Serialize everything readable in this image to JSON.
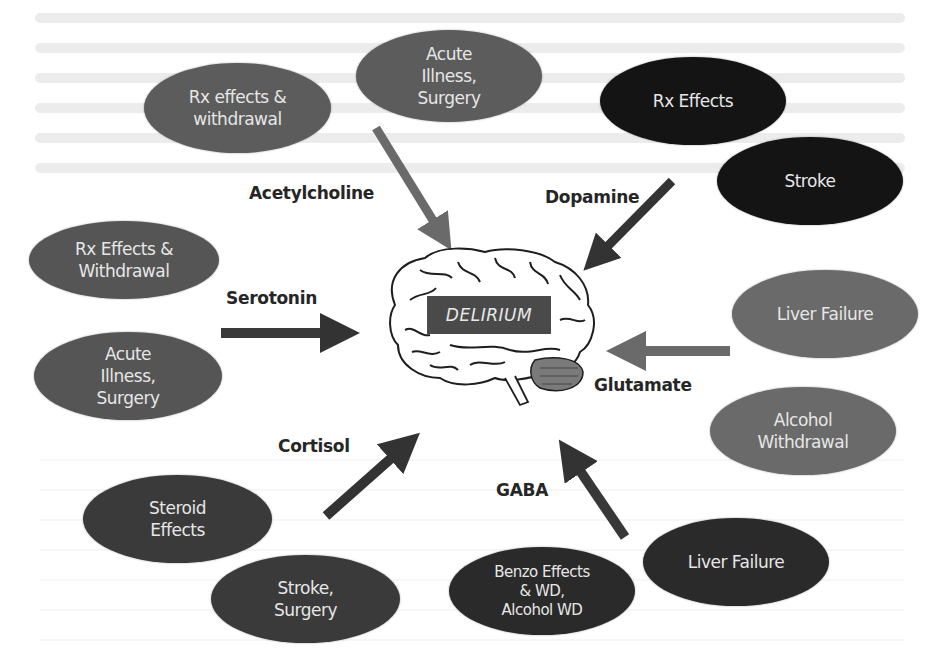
{
  "center": {
    "label": "DELIRIUM",
    "icon": "brain-icon"
  },
  "neurotransmitters": [
    {
      "id": "acetylcholine",
      "label": "Acetylcholine"
    },
    {
      "id": "dopamine",
      "label": "Dopamine"
    },
    {
      "id": "serotonin",
      "label": "Serotonin"
    },
    {
      "id": "glutamate",
      "label": "Glutamate"
    },
    {
      "id": "cortisol",
      "label": "Cortisol"
    },
    {
      "id": "gaba",
      "label": "GABA"
    }
  ],
  "causes": [
    {
      "id": "ach-rx",
      "group": "acetylcholine",
      "label": "Rx effects &\nwithdrawal",
      "color": "#5a5a5a"
    },
    {
      "id": "ach-acute",
      "group": "acetylcholine",
      "label": "Acute\nIllness,\nSurgery",
      "color": "#5a5a5a"
    },
    {
      "id": "dop-rx",
      "group": "dopamine",
      "label": "Rx Effects",
      "color": "#141414"
    },
    {
      "id": "dop-stroke",
      "group": "dopamine",
      "label": "Stroke",
      "color": "#141414"
    },
    {
      "id": "ser-rx",
      "group": "serotonin",
      "label": "Rx Effects &\nWithdrawal",
      "color": "#555555"
    },
    {
      "id": "ser-acute",
      "group": "serotonin",
      "label": "Acute\nIllness,\nSurgery",
      "color": "#555555"
    },
    {
      "id": "glu-liver",
      "group": "glutamate",
      "label": "Liver Failure",
      "color": "#6a6a6a"
    },
    {
      "id": "glu-alcohol",
      "group": "glutamate",
      "label": "Alcohol\nWithdrawal",
      "color": "#6a6a6a"
    },
    {
      "id": "cor-steroid",
      "group": "cortisol",
      "label": "Steroid\nEffects",
      "color": "#3a3a3a"
    },
    {
      "id": "cor-stroke",
      "group": "cortisol",
      "label": "Stroke,\nSurgery",
      "color": "#3a3a3a"
    },
    {
      "id": "gaba-benzo",
      "group": "gaba",
      "label": "Benzo Effects\n& WD,\nAlcohol WD",
      "color": "#2a2a2a"
    },
    {
      "id": "gaba-liver",
      "group": "gaba",
      "label": "Liver Failure",
      "color": "#2a2a2a"
    }
  ],
  "arrow_colors": {
    "acetylcholine": "#6a6a6a",
    "dopamine": "#333333",
    "serotonin": "#3a3a3a",
    "glutamate": "#6a6a6a",
    "cortisol": "#333333",
    "gaba": "#383838"
  }
}
